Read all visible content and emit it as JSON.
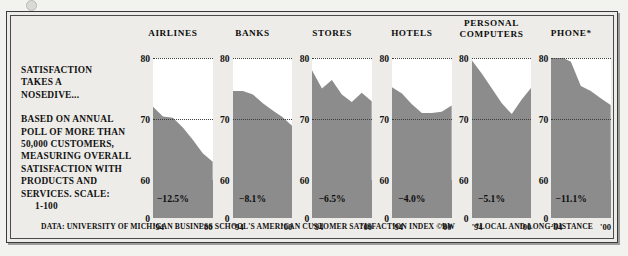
{
  "figure": {
    "headline_lines": [
      "SATISFACTION",
      "TAKES A",
      "NOSEDIVE..."
    ],
    "subtext_lines": [
      "BASED ON ANNUAL",
      "POLL OF MORE THAN",
      "50,000 CUSTOMERS,",
      "MEASURING OVERALL",
      "SATISFACTION WITH",
      "PRODUCTS AND",
      "SERVICES. SCALE:",
      "1-100"
    ],
    "footer_source": "DATA: UNIVERSITY OF MICHIGAN BUSINESS SCHOOL'S AMERICAN CUSTOMER SATISFACTION INDEX ©BW",
    "footer_note": "*LOCAL AND LONG-DISTANCE",
    "colors": {
      "area_fill": "#8c8c8c",
      "panel_bg": "#edece8",
      "plot_bg": "#ffffff",
      "text": "#101010",
      "frame": "#3a3a3a"
    }
  },
  "chart_data": {
    "type": "area",
    "title": "SATISFACTION TAKES A NOSEDIVE...",
    "xlabel": "",
    "ylabel": "",
    "ylim": [
      0,
      80
    ],
    "yticks": [
      "80",
      "70",
      "60",
      "0"
    ],
    "xticks": [
      "'94",
      "'00"
    ],
    "x": [
      "'94",
      "'95",
      "'96",
      "'97",
      "'98",
      "'99",
      "'00"
    ],
    "grid": "dotted horizontal at 80 and 70",
    "legend": "none",
    "axis_break": "y-axis broken between 0 and 60",
    "panels": [
      {
        "name": "AIRLINES",
        "change_label": "−12.5%",
        "change_value": -12.5,
        "values": [
          72.0,
          70.4,
          70.2,
          68.6,
          66.6,
          64.4,
          63.0
        ]
      },
      {
        "name": "BANKS",
        "change_label": "−8.1%",
        "change_value": -8.1,
        "values": [
          74.6,
          74.6,
          74.0,
          72.6,
          71.4,
          70.3,
          68.8
        ]
      },
      {
        "name": "STORES",
        "change_label": "−6.5%",
        "change_value": -6.5,
        "values": [
          78.0,
          75.0,
          76.4,
          74.0,
          72.8,
          74.3,
          72.9
        ]
      },
      {
        "name": "HOTELS",
        "change_label": "−4.0%",
        "change_value": -4.0,
        "values": [
          75.2,
          74.2,
          72.4,
          71.0,
          71.0,
          71.2,
          72.2
        ]
      },
      {
        "name": "PERSONAL COMPUTERS",
        "change_label": "−5.1%",
        "change_value": -5.1,
        "values": [
          79.6,
          77.4,
          75.0,
          72.6,
          70.8,
          73.2,
          75.2
        ]
      },
      {
        "name": "PHONE*",
        "change_label": "−11.1%",
        "change_value": -11.1,
        "values": [
          80.4,
          80.2,
          79.4,
          75.4,
          74.6,
          73.4,
          72.3
        ]
      }
    ]
  }
}
